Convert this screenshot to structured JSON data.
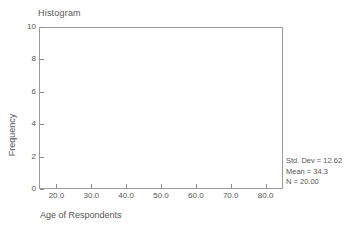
{
  "chart_data": {
    "type": "bar",
    "title": "Histogram",
    "xlabel": "Age of Respondents",
    "ylabel": "Frequency",
    "xlim": [
      15,
      85
    ],
    "ylim": [
      0,
      10
    ],
    "xticks": [
      20,
      30,
      40,
      50,
      60,
      70,
      80
    ],
    "xtick_labels": [
      "20.0",
      "30.0",
      "40.0",
      "50.0",
      "60.0",
      "70.0",
      "80.0"
    ],
    "yticks": [
      0,
      2,
      4,
      6,
      8,
      10
    ],
    "ytick_labels": [
      "0",
      "2",
      "4",
      "6",
      "8",
      "10"
    ],
    "grid": false,
    "legend": "none",
    "categories": [],
    "values": [],
    "bar_color": "#b0b0b0",
    "frame_color": "#9a9a9a",
    "text_color": "#555555",
    "note": "empty plot area - no bars rendered"
  },
  "annotations": {
    "std_dev": "Std. Dev = 12.62",
    "mean": "Mean = 34.3",
    "n": "N = 20.00"
  }
}
